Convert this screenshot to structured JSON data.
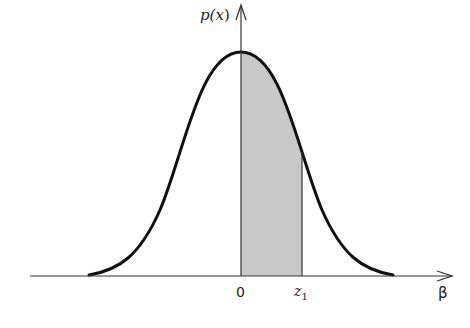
{
  "figure": {
    "type": "normal-distribution-area",
    "y_axis_label": "p(x)",
    "x_axis_label": "β",
    "tick_labels": [
      "0",
      "z₁"
    ],
    "shaded_region": {
      "from": "0",
      "to": "z₁"
    },
    "colors": {
      "curve": "#111111",
      "shade": "#c8c8c8",
      "axis": "#333333"
    }
  },
  "labels": {
    "p": "p(",
    "x": "x",
    "close": ")",
    "beta": "β",
    "zero": "0",
    "z": "z",
    "z_sub": "1"
  }
}
